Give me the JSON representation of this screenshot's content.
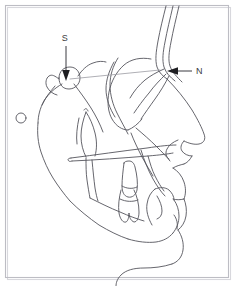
{
  "figure": {
    "type": "line-drawing",
    "background_color": "#ffffff",
    "trace_color": "#55555c",
    "frame_color": "#bdbdc4",
    "label_color": "#3a3a40",
    "width": 238,
    "height": 286
  },
  "annotations": [
    {
      "id": "sella",
      "label": "S",
      "label_x": 65,
      "label_y": 41,
      "arrow_from_x": 66,
      "arrow_from_y": 46,
      "arrow_to_x": 66,
      "arrow_to_y": 79,
      "arrow_direction": "down",
      "points_at": "sella-turcica"
    },
    {
      "id": "nasion",
      "label": "N",
      "label_x": 195,
      "label_y": 74,
      "arrow_from_x": 190,
      "arrow_from_y": 71,
      "arrow_to_x": 168,
      "arrow_to_y": 71,
      "arrow_direction": "left",
      "points_at": "nasion"
    }
  ],
  "markers": [
    {
      "id": "porion-ring",
      "shape": "circle",
      "cx": 21,
      "cy": 118,
      "r": 5
    }
  ]
}
